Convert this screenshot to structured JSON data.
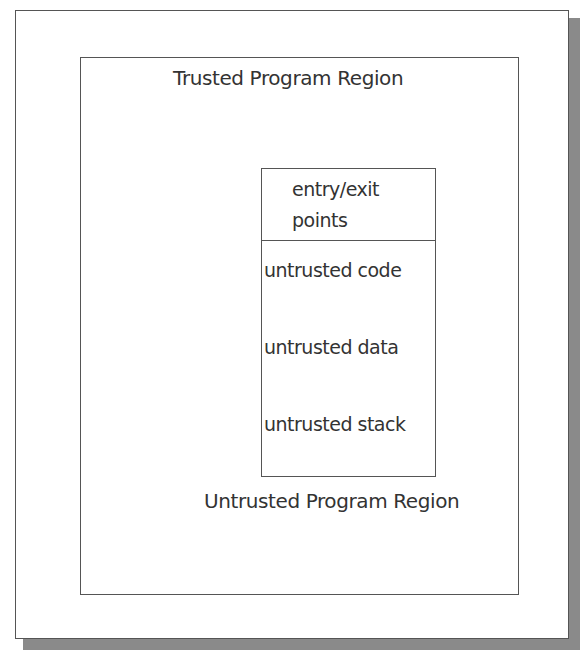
{
  "diagram": {
    "trusted_region_label": "Trusted Program Region",
    "untrusted_region_label": "Untrusted Program Region",
    "untrusted_box": {
      "header_line1": "entry/exit",
      "header_line2": "points",
      "items": [
        "untrusted code",
        "untrusted data",
        "untrusted stack"
      ]
    }
  }
}
